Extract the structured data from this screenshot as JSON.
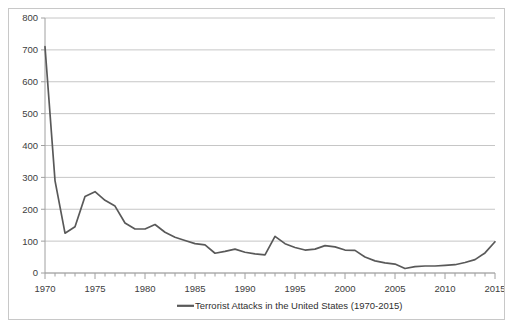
{
  "chart_data": {
    "type": "line",
    "title": "",
    "subtitle": "",
    "xlabel": "",
    "ylabel": "",
    "xlim": [
      1970,
      2015
    ],
    "ylim": [
      0,
      800
    ],
    "ytick_step": 100,
    "yticks": [
      0,
      100,
      200,
      300,
      400,
      500,
      600,
      700,
      800
    ],
    "ytick_labels": [
      "0",
      "100",
      "200",
      "300",
      "400",
      "500",
      "600",
      "700",
      "800"
    ],
    "xticks_labeled": [
      1970,
      1975,
      1980,
      1985,
      1990,
      1995,
      2000,
      2005,
      2010,
      2015
    ],
    "xtick_labels": [
      "1970",
      "1975",
      "1980",
      "1985",
      "1990",
      "1995",
      "2000",
      "2005",
      "2010",
      "2015"
    ],
    "xtick_minor_step": 1,
    "grid": "horizontal",
    "legend_position": "bottom-center",
    "series": [
      {
        "name": "Terrorist Attacks in the United States (1970-2015)",
        "color": "#595959",
        "x": [
          1970,
          1971,
          1972,
          1973,
          1974,
          1975,
          1976,
          1977,
          1978,
          1979,
          1980,
          1981,
          1982,
          1983,
          1984,
          1985,
          1986,
          1987,
          1988,
          1989,
          1990,
          1991,
          1992,
          1993,
          1994,
          1995,
          1996,
          1997,
          1998,
          1999,
          2000,
          2001,
          2002,
          2003,
          2004,
          2005,
          2006,
          2007,
          2008,
          2009,
          2010,
          2011,
          2012,
          2013,
          2014,
          2015
        ],
        "values": [
          710,
          290,
          125,
          145,
          240,
          255,
          228,
          210,
          157,
          138,
          138,
          152,
          128,
          112,
          102,
          92,
          88,
          62,
          68,
          75,
          65,
          60,
          57,
          115,
          92,
          80,
          72,
          75,
          86,
          82,
          72,
          71,
          50,
          38,
          32,
          28,
          14,
          20,
          22,
          22,
          24,
          26,
          33,
          42,
          63,
          98
        ],
        "units": "attacks"
      }
    ]
  },
  "legend": {
    "entries": [
      {
        "label": "Terrorist Attacks in the United States (1970-2015)",
        "color": "#595959"
      }
    ]
  },
  "colors": {
    "series_line": "#595959",
    "gridline": "#b8b8b8",
    "axis": "#a0a0a0",
    "frame_border": "#c8c8c8",
    "text": "#404040",
    "background": "#ffffff"
  }
}
